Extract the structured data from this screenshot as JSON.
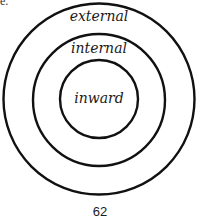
{
  "diagram": {
    "type": "concentric-circles",
    "center": {
      "x": 99,
      "y": 99
    },
    "stroke_color": "#111111",
    "stroke_width": 2.4,
    "rings": [
      {
        "name": "outer",
        "radius": 96,
        "label": "external"
      },
      {
        "name": "middle",
        "radius": 66,
        "label": "internal"
      },
      {
        "name": "inner",
        "radius": 39,
        "label": "inward"
      }
    ]
  },
  "page": {
    "number": "62",
    "corner_fragment": "e."
  }
}
